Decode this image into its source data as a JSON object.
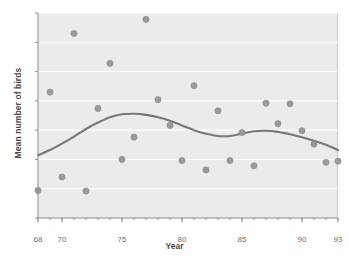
{
  "chart_data": {
    "type": "scatter",
    "title": "",
    "xlabel": "Year",
    "ylabel": "Mean number of birds",
    "xlim": [
      68,
      93
    ],
    "ylim": [
      0,
      3.5
    ],
    "grid": true,
    "legend": "none",
    "xticks": [
      68,
      70,
      75,
      80,
      85,
      90,
      93
    ],
    "xtick_labels": [
      "68",
      "70",
      "75",
      "80",
      "85",
      "90",
      "93"
    ],
    "xminor_tick_step": 1,
    "yticks": [
      0,
      0.5,
      1.0,
      1.5,
      2.0,
      2.5,
      3.0,
      3.5
    ],
    "ytick_labels": [
      "0",
      "0.5",
      "1.0",
      "1.5",
      "2.0",
      "2.5",
      "3.0",
      "3.5"
    ],
    "marker_color": "#9a9a9a",
    "line_color": "#787878",
    "plot_background": "#ebebeb",
    "gridline_color": "#ffffff",
    "points": [
      {
        "x": 68,
        "y": 0.47
      },
      {
        "x": 69,
        "y": 2.15
      },
      {
        "x": 70,
        "y": 0.7
      },
      {
        "x": 71,
        "y": 3.15
      },
      {
        "x": 72,
        "y": 0.46
      },
      {
        "x": 73,
        "y": 1.87
      },
      {
        "x": 74,
        "y": 2.64
      },
      {
        "x": 75,
        "y": 1.0
      },
      {
        "x": 76,
        "y": 1.38
      },
      {
        "x": 77,
        "y": 3.39
      },
      {
        "x": 78,
        "y": 2.02
      },
      {
        "x": 79,
        "y": 1.58
      },
      {
        "x": 80,
        "y": 0.98
      },
      {
        "x": 81,
        "y": 2.26
      },
      {
        "x": 82,
        "y": 0.82
      },
      {
        "x": 83,
        "y": 1.83
      },
      {
        "x": 84,
        "y": 0.98
      },
      {
        "x": 85,
        "y": 1.46
      },
      {
        "x": 86,
        "y": 0.89
      },
      {
        "x": 87,
        "y": 1.96
      },
      {
        "x": 88,
        "y": 1.61
      },
      {
        "x": 89,
        "y": 1.95
      },
      {
        "x": 90,
        "y": 1.49
      },
      {
        "x": 91,
        "y": 1.26
      },
      {
        "x": 92,
        "y": 0.95
      },
      {
        "x": 93,
        "y": 0.97
      }
    ],
    "trend_line": {
      "name": "smoothed trend",
      "x": [
        68,
        69,
        70,
        71,
        72,
        73,
        74,
        75,
        76,
        77,
        78,
        79,
        80,
        81,
        82,
        83,
        84,
        85,
        86,
        87,
        88,
        89,
        90,
        91,
        92,
        93
      ],
      "y": [
        1.07,
        1.16,
        1.27,
        1.39,
        1.52,
        1.63,
        1.72,
        1.77,
        1.78,
        1.76,
        1.72,
        1.66,
        1.58,
        1.5,
        1.44,
        1.4,
        1.4,
        1.44,
        1.48,
        1.49,
        1.47,
        1.43,
        1.38,
        1.32,
        1.25,
        1.16
      ]
    }
  }
}
